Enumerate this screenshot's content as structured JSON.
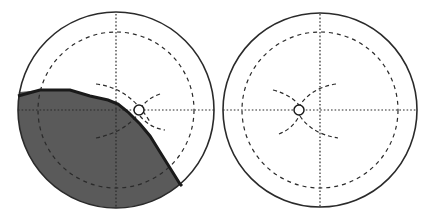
{
  "figure": {
    "description": "Two circular visual-field style diagrams with concentric dashed circle, dotted crosshair axes, dashed arcs crossing at a small fixation target; left diagram has a dark shaded region in the lower-left bounded by a thick boundary line.",
    "colors": {
      "background": "#ffffff",
      "outline": "#2a2a2a",
      "shade": "#5a5a5a",
      "boundary": "#1a1a1a"
    },
    "panels": [
      {
        "id": "left",
        "center": [
          116,
          110
        ],
        "outer_radius": 98,
        "inner_dashed_radius": 78,
        "target": [
          139,
          110
        ],
        "shaded": true
      },
      {
        "id": "right",
        "center": [
          320,
          110
        ],
        "outer_radius": 97,
        "inner_dashed_radius": 78,
        "target": [
          299,
          110
        ],
        "shaded": false
      }
    ]
  }
}
